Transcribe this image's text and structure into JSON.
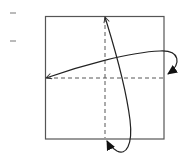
{
  "diagram": {
    "type": "origami-fold-instruction",
    "colors": {
      "stroke": "#333333",
      "dashed": "#444444",
      "background": "#ffffff"
    },
    "paper": {
      "shape": "square",
      "x": 45,
      "y": 16,
      "width": 119,
      "height": 123
    },
    "fold_lines": [
      {
        "name": "vertical-valley-fold",
        "style": "dashed",
        "x1": 105,
        "y1": 17,
        "x2": 105,
        "y2": 139
      },
      {
        "name": "horizontal-valley-fold",
        "style": "dashed",
        "x1": 45,
        "y1": 78,
        "x2": 164,
        "y2": 78
      }
    ],
    "arrows": [
      {
        "name": "horizontal-fold-and-unfold-arrow",
        "from": "right-edge-midpoint",
        "to": "left-edge-midpoint"
      },
      {
        "name": "vertical-fold-and-unfold-arrow",
        "from": "bottom-edge-midpoint",
        "to": "top-edge-midpoint"
      }
    ],
    "margin_marks": [
      {
        "name": "tick-mark-1",
        "x": 10,
        "y": 13
      },
      {
        "name": "tick-mark-2",
        "x": 10,
        "y": 41
      }
    ]
  }
}
